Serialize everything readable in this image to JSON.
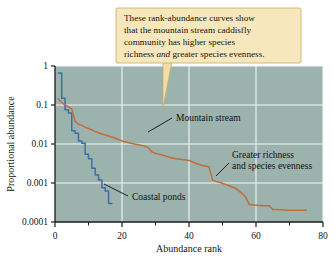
{
  "figure": {
    "background_color": "#ffffff",
    "plot_background_color": "#9cb2ad",
    "gridline_color": "#f2f6f4",
    "axis_color": "#1c1c1c"
  },
  "callout": {
    "name": "callout-box",
    "background_color": "#f6e7bd",
    "border_color": "#c9ab62",
    "pointer_color": "#f0dda8",
    "lines": [
      "These rank-abundance curves show",
      "that the mountain stream caddisfly",
      "community has higher species"
    ],
    "line4_part1": "richness ",
    "line4_emphasis": "and",
    "line4_part2": " greater species evenness."
  },
  "annotations": [
    {
      "name": "annotation-mountain-stream",
      "label": "Mountain stream"
    },
    {
      "name": "annotation-greater-richness-line1",
      "label": "Greater richness"
    },
    {
      "name": "annotation-greater-richness-line2",
      "label": "and species evenness"
    },
    {
      "name": "annotation-coastal-ponds",
      "label": "Coastal ponds"
    }
  ],
  "chart_data": {
    "type": "line",
    "title": "",
    "xlabel": "Abundance rank",
    "ylabel": "Proportional abundance",
    "yscale": "log",
    "xscale": "linear",
    "xlim": [
      0,
      80
    ],
    "ylim": [
      0.0001,
      1
    ],
    "grid": true,
    "legend_position": "inline-annotations",
    "xticks": [
      0,
      20,
      40,
      60,
      80
    ],
    "xtick_labels": [
      "0",
      "20",
      "40",
      "60",
      "80"
    ],
    "xminor_ticks": [
      10,
      30,
      50,
      70
    ],
    "yticks": [
      1,
      0.1,
      0.01,
      0.001,
      0.0001
    ],
    "ytick_labels": [
      "1",
      "0.1",
      "0.01",
      "0.001",
      "0.0001"
    ],
    "series": [
      {
        "name": "Coastal ponds",
        "color": "#3d6fa4",
        "x": [
          1,
          2,
          2,
          3,
          3,
          4,
          4,
          5,
          5,
          6,
          6,
          7,
          7,
          8,
          8,
          9,
          9,
          10,
          10,
          11,
          11,
          12,
          12,
          13,
          13,
          14,
          14,
          15,
          15,
          16,
          16,
          17
        ],
        "y": [
          0.66,
          0.66,
          0.15,
          0.15,
          0.075,
          0.075,
          0.062,
          0.062,
          0.022,
          0.022,
          0.019,
          0.019,
          0.012,
          0.012,
          0.0105,
          0.0105,
          0.0055,
          0.0055,
          0.0042,
          0.0042,
          0.0024,
          0.0024,
          0.0016,
          0.0016,
          0.0012,
          0.0012,
          0.00075,
          0.00075,
          0.00062,
          0.00062,
          0.0003,
          0.0003
        ]
      },
      {
        "name": "Mountain stream",
        "color": "#c46b3c",
        "x": [
          1,
          2,
          3,
          4,
          5,
          6,
          7,
          8,
          9,
          10,
          12,
          14,
          16,
          18,
          20,
          22,
          24,
          26,
          27,
          28,
          29,
          30,
          32,
          34,
          36,
          38,
          40,
          42,
          44,
          46,
          47,
          48,
          50,
          52,
          54,
          55,
          56,
          57,
          58,
          60,
          62,
          64,
          65,
          66,
          70,
          75
        ],
        "y": [
          0.145,
          0.115,
          0.1,
          0.09,
          0.08,
          0.038,
          0.032,
          0.03,
          0.027,
          0.025,
          0.021,
          0.018,
          0.016,
          0.014,
          0.012,
          0.0108,
          0.0098,
          0.0092,
          0.0088,
          0.0078,
          0.0062,
          0.0058,
          0.0052,
          0.0046,
          0.0042,
          0.004,
          0.0038,
          0.0032,
          0.0028,
          0.0026,
          0.0012,
          0.0011,
          0.00098,
          0.00085,
          0.00072,
          0.00062,
          0.00052,
          0.00042,
          0.00028,
          0.00027,
          0.00026,
          0.00026,
          0.00021,
          0.00021,
          0.0002,
          0.0002
        ]
      }
    ]
  }
}
